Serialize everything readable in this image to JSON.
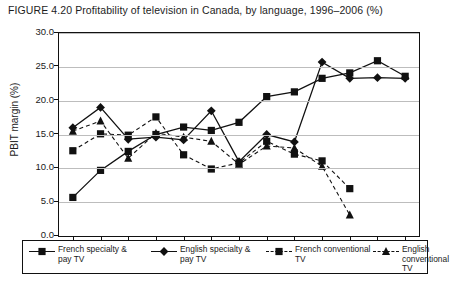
{
  "figure": {
    "title": "FIGURE 4.20 Profitability of television in Canada, by language, 1996–2006 (%)"
  },
  "chart_data": {
    "type": "line",
    "title": "FIGURE 4.20 Profitability of television in Canada, by language, 1996–2006 (%)",
    "xlabel": "",
    "ylabel": "PBIT margin (%)",
    "ylim": [
      0.0,
      30.0
    ],
    "yticks": [
      "0.0",
      "5.0",
      "10.0",
      "15.0",
      "20.0",
      "25.0",
      "30.0"
    ],
    "ytick_values": [
      0.0,
      5.0,
      10.0,
      15.0,
      20.0,
      25.0,
      30.0
    ],
    "grid": true,
    "legend_position": "bottom",
    "categories": [
      "1996",
      "1997",
      "1998",
      "1999",
      "2000",
      "2001",
      "2002",
      "2003",
      "2004",
      "2005",
      "2006",
      "2007",
      "2008"
    ],
    "series": [
      {
        "name": "French specialty & pay TV",
        "marker": "square",
        "line": "solid",
        "color": "#111111",
        "values": [
          5.7,
          9.7,
          12.5,
          15.0,
          16.1,
          15.6,
          16.8,
          20.6,
          21.3,
          23.3,
          24.1,
          25.9,
          23.6
        ]
      },
      {
        "name": "English specialty & pay TV",
        "marker": "diamond",
        "line": "solid",
        "color": "#111111",
        "values": [
          16.0,
          19.0,
          14.3,
          14.6,
          14.2,
          18.5,
          11.0,
          15.0,
          13.9,
          25.7,
          23.3,
          23.4,
          23.3
        ]
      },
      {
        "name": "French conventional TV",
        "marker": "square",
        "line": "dashed",
        "color": "#111111",
        "values": [
          12.6,
          15.1,
          14.9,
          17.6,
          12.0,
          9.9,
          10.8,
          14.0,
          12.1,
          11.1,
          7.0,
          null,
          null
        ]
      },
      {
        "name": "English conventional TV",
        "marker": "triangle",
        "line": "dashed",
        "color": "#111111",
        "values": [
          15.5,
          17.0,
          11.5,
          15.2,
          14.6,
          14.0,
          10.6,
          13.3,
          13.0,
          10.3,
          3.1,
          null,
          null
        ]
      }
    ]
  },
  "axes": {
    "y_label": "PBIT margin (%)",
    "y_ticks": [
      "30.0",
      "25.0",
      "20.0",
      "15.0",
      "10.0",
      "5.0",
      "0.0"
    ],
    "x_ticks": [
      "1996",
      "1997",
      "1998",
      "1999",
      "2000",
      "2001",
      "2002",
      "2003",
      "2004",
      "2005",
      "2006",
      "2007",
      "2008"
    ]
  },
  "legend": {
    "items": [
      {
        "label": "French specialty &\npay TV",
        "marker": "square",
        "line": "solid"
      },
      {
        "label": "English specialty &\npay TV",
        "marker": "diamond",
        "line": "solid"
      },
      {
        "label": "French conventional\nTV",
        "marker": "square",
        "line": "dashed"
      },
      {
        "label": "English conventional\nTV",
        "marker": "triangle",
        "line": "dashed"
      }
    ]
  }
}
